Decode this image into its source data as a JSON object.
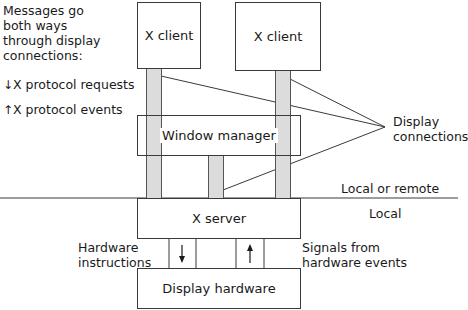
{
  "legend": {
    "intro": [
      "Messages go",
      "both ways",
      "through display",
      "connections:"
    ],
    "requests_label": "X protocol requests",
    "events_label": "X protocol events"
  },
  "boxes": {
    "client_left": "X client",
    "client_right": "X client",
    "window_manager": "Window manager",
    "x_server": "X server",
    "display_hardware": "Display hardware"
  },
  "labels": {
    "display_connections": [
      "Display",
      "connections"
    ],
    "local_or_remote": "Local or remote",
    "local": "Local",
    "hardware_instructions": [
      "Hardware",
      "instructions"
    ],
    "signals_from_hardware": [
      "Signals from",
      "hardware events"
    ]
  },
  "colors": {
    "connection_bar": "#dcdcdc",
    "line": "#3a3a3a"
  }
}
